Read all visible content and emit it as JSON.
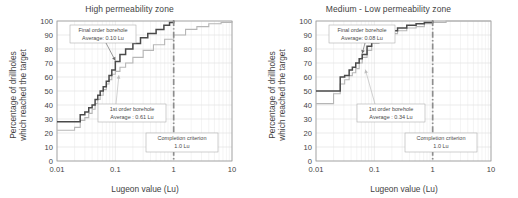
{
  "figure": {
    "background": "#ffffff",
    "panel_count": 2
  },
  "axes": {
    "xlabel": "Lugeon value (Lu)",
    "ylabel_line1": "Percentage of drillholes",
    "ylabel_line2": "which reached the target",
    "x_tick_labels": [
      "0.01",
      "0.1",
      "1",
      "10"
    ],
    "y_tick_labels": [
      "0",
      "10",
      "20",
      "30",
      "40",
      "50",
      "60",
      "70",
      "80",
      "90",
      "100"
    ]
  },
  "colors": {
    "final_order_curve": "#4a4a4a",
    "first_order_curve": "#b6b6b6",
    "criterion_line": "#8d8d8d",
    "grid": "#d6d6d6",
    "axis": "#9a9a9a",
    "text": "#3f3f3f"
  },
  "left_panel": {
    "title": "High permeability zone",
    "final_callout": {
      "line1": "Final order borehole",
      "line2": "Average: 0.10 Lu"
    },
    "first_callout": {
      "line1": "1st order borehole",
      "line2": "Average : 0.61 Lu"
    },
    "criterion_callout": {
      "line1": "Completion criterion",
      "line2": "1.0 Lu"
    }
  },
  "right_panel": {
    "title": "Medium - Low permeability zone",
    "final_callout": {
      "line1": "Final order borehole",
      "line2": "Average: 0.08 Lu"
    },
    "first_callout": {
      "line1": "1st order borehole",
      "line2": "Average : 0.34 Lu"
    },
    "criterion_callout": {
      "line1": "Completion criterion",
      "line2": "1.0 Lu"
    }
  },
  "chart_data": [
    {
      "type": "line",
      "title": "High permeability zone",
      "xlabel": "Lugeon value (Lu)",
      "ylabel": "Percentage of drillholes which reached the target",
      "xscale": "log",
      "xlim": [
        0.01,
        10
      ],
      "ylim": [
        0,
        100
      ],
      "grid": true,
      "legend": "annotations",
      "annotations": [
        {
          "text": "Final order borehole Average: 0.10 Lu",
          "target_x": 0.1,
          "target_y": 71
        },
        {
          "text": "1st order borehole Average : 0.61 Lu",
          "target_x": 0.115,
          "target_y": 62
        },
        {
          "text": "Completion criterion 1.0 Lu",
          "target_x": 1.0
        }
      ],
      "reference_lines": [
        {
          "x": 1.0,
          "label": "Completion criterion 1.0 Lu",
          "style": "dash-dot"
        }
      ],
      "series": [
        {
          "name": "Final order borehole",
          "style": "step",
          "average": 0.1,
          "color": "#4a4a4a",
          "x": [
            0.01,
            0.02,
            0.025,
            0.03,
            0.035,
            0.04,
            0.045,
            0.05,
            0.055,
            0.062,
            0.07,
            0.078,
            0.087,
            0.1,
            0.12,
            0.15,
            0.2,
            0.27,
            0.36,
            0.5,
            0.68,
            0.85,
            1.0
          ],
          "y": [
            28,
            28,
            33,
            35,
            38,
            40,
            44,
            47,
            50,
            53,
            57,
            61,
            65,
            71,
            76,
            80,
            84,
            88,
            91,
            94,
            97,
            99,
            100
          ]
        },
        {
          "name": "1st order borehole",
          "style": "step",
          "average": 0.61,
          "color": "#b6b6b6",
          "x": [
            0.01,
            0.02,
            0.025,
            0.03,
            0.035,
            0.04,
            0.045,
            0.05,
            0.055,
            0.062,
            0.07,
            0.078,
            0.087,
            0.1,
            0.12,
            0.15,
            0.2,
            0.3,
            0.45,
            0.7,
            1.0,
            1.6,
            2.5,
            4.0,
            6.5,
            10.0
          ],
          "y": [
            22,
            24,
            29,
            31,
            34,
            37,
            41,
            44,
            47,
            51,
            55,
            58,
            62,
            64,
            67,
            70,
            74,
            79,
            83,
            87,
            90,
            94,
            96,
            98,
            99,
            100
          ]
        }
      ]
    },
    {
      "type": "line",
      "title": "Medium - Low permeability zone",
      "xlabel": "Lugeon value (Lu)",
      "ylabel": "Percentage of drillholes which reached the target",
      "xscale": "log",
      "xlim": [
        0.01,
        10
      ],
      "ylim": [
        0,
        100
      ],
      "grid": true,
      "legend": "annotations",
      "annotations": [
        {
          "text": "Final order borehole Average: 0.08 Lu",
          "target_x": 0.062,
          "target_y": 76
        },
        {
          "text": "1st order borehole Average : 0.34 Lu",
          "target_x": 0.07,
          "target_y": 66
        },
        {
          "text": "Completion criterion 1.0 Lu",
          "target_x": 1.0
        }
      ],
      "reference_lines": [
        {
          "x": 1.0,
          "label": "Completion criterion 1.0 Lu",
          "style": "dash-dot"
        }
      ],
      "series": [
        {
          "name": "Final order borehole",
          "style": "step",
          "average": 0.08,
          "color": "#4a4a4a",
          "x": [
            0.01,
            0.02,
            0.026,
            0.031,
            0.037,
            0.042,
            0.048,
            0.055,
            0.062,
            0.075,
            0.09,
            0.12,
            0.17,
            0.25,
            0.36,
            0.52,
            0.72,
            1.0
          ],
          "y": [
            50,
            50,
            60,
            61,
            65,
            67,
            70,
            73,
            76,
            82,
            86,
            90,
            93,
            95,
            97,
            98,
            99,
            100
          ]
        },
        {
          "name": "1st order borehole",
          "style": "step",
          "average": 0.34,
          "color": "#b6b6b6",
          "x": [
            0.01,
            0.02,
            0.026,
            0.031,
            0.037,
            0.042,
            0.048,
            0.055,
            0.062,
            0.075,
            0.09,
            0.12,
            0.17,
            0.25,
            0.36,
            0.52,
            0.72,
            1.0,
            1.7,
            3.0,
            5.5,
            10.0
          ],
          "y": [
            41,
            48,
            55,
            58,
            61,
            63,
            66,
            70,
            74,
            79,
            84,
            88,
            91,
            93,
            95,
            96,
            98,
            99,
            100,
            100,
            100,
            100
          ]
        }
      ]
    }
  ]
}
